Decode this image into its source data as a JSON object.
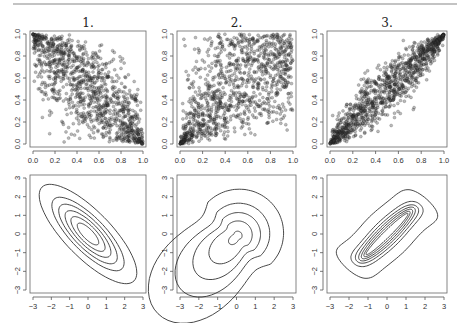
{
  "figure": {
    "rule": {
      "x1": 13,
      "x2": 457,
      "y": 4,
      "color": "#888888"
    },
    "panel_titles": [
      "1.",
      "2.",
      "3."
    ]
  },
  "chart_data": [
    {
      "type": "scatter",
      "panel": "1.",
      "title": "1.",
      "description": "Copula sample with strong negative dependence (counter-monotonic trend), dense near (0,1) and (1,0)",
      "xlabel": "",
      "ylabel": "",
      "xlim": [
        0,
        1
      ],
      "ylim": [
        0,
        1
      ],
      "xticks": [
        "0.0",
        "0.2",
        "0.4",
        "0.6",
        "0.8",
        "1.0"
      ],
      "yticks": [
        "0.0",
        "0.2",
        "0.4",
        "0.6",
        "0.8",
        "1.0"
      ],
      "n_points_approx": 2000,
      "dependence": "negative",
      "grid": false
    },
    {
      "type": "scatter",
      "panel": "2.",
      "title": "2.",
      "description": "Copula sample with positive lower-tail dependence (clustered at (0,0)), diffuse elsewhere",
      "xlabel": "",
      "ylabel": "",
      "xlim": [
        0,
        1
      ],
      "ylim": [
        0,
        1
      ],
      "xticks": [
        "0.0",
        "0.2",
        "0.4",
        "0.6",
        "0.8",
        "1.0"
      ],
      "yticks": [
        "0.0",
        "0.2",
        "0.4",
        "0.6",
        "0.8",
        "1.0"
      ],
      "n_points_approx": 2000,
      "dependence": "lower-tail",
      "grid": false
    },
    {
      "type": "scatter",
      "panel": "3.",
      "title": "3.",
      "description": "Copula sample with strong positive dependence concentrated along the diagonal",
      "xlabel": "",
      "ylabel": "",
      "xlim": [
        0,
        1
      ],
      "ylim": [
        0,
        1
      ],
      "xticks": [
        "0.0",
        "0.2",
        "0.4",
        "0.6",
        "0.8",
        "1.0"
      ],
      "yticks": [
        "0.0",
        "0.2",
        "0.4",
        "0.6",
        "0.8",
        "1.0"
      ],
      "n_points_approx": 2000,
      "dependence": "strong-positive",
      "grid": false
    },
    {
      "type": "contour",
      "panel": "1. (density)",
      "description": "Elliptical contours oriented along the negative diagonal",
      "xlim": [
        -3,
        3
      ],
      "ylim": [
        -3,
        3
      ],
      "xticks": [
        "-3",
        "-2",
        "-1",
        "0",
        "1",
        "2",
        "3"
      ],
      "yticks": [
        "-3",
        "-2",
        "-1",
        "0",
        "1",
        "2",
        "3"
      ],
      "n_levels": 6,
      "grid": false
    },
    {
      "type": "contour",
      "panel": "2. (density)",
      "description": "Teardrop contours with tail toward (-3,-3), bulge toward upper-right",
      "xlim": [
        -3,
        3
      ],
      "ylim": [
        -3,
        3
      ],
      "xticks": [
        "-3",
        "-2",
        "-1",
        "0",
        "1",
        "2",
        "3"
      ],
      "yticks": [
        "-3",
        "-2",
        "-1",
        "0",
        "1",
        "2",
        "3"
      ],
      "n_levels": 5,
      "grid": false
    },
    {
      "type": "contour",
      "panel": "3. (density)",
      "description": "Narrow elongated contours along positive diagonal with flared outer tails",
      "xlim": [
        -3,
        3
      ],
      "ylim": [
        -3,
        3
      ],
      "xticks": [
        "-3",
        "-2",
        "-1",
        "0",
        "1",
        "2",
        "3"
      ],
      "yticks": [
        "-3",
        "-2",
        "-1",
        "0",
        "1",
        "2",
        "3"
      ],
      "n_levels": 7,
      "grid": false
    }
  ]
}
